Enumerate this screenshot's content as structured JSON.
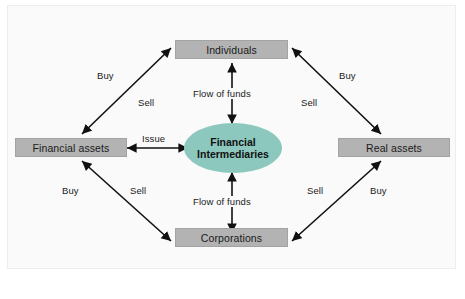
{
  "diagram": {
    "background_color": "#fafafa",
    "node_fill_color": "#b3b3b3",
    "intermediary_fill_color": "#8cc8bd",
    "line_color": "#111111",
    "nodes": {
      "individuals": {
        "label": "Individuals",
        "shape": "rectangle"
      },
      "corporations": {
        "label": "Corporations",
        "shape": "rectangle"
      },
      "financial_assets": {
        "label": "Financial assets",
        "shape": "rectangle"
      },
      "real_assets": {
        "label": "Real assets",
        "shape": "rectangle"
      },
      "intermediaries": {
        "label_line1": "Financial",
        "label_line2": "Intermediaries",
        "shape": "ellipse"
      }
    },
    "edge_labels": {
      "top_left_buy": "Buy",
      "top_left_sell": "Sell",
      "top_right_buy": "Buy",
      "top_right_sell": "Sell",
      "bottom_left_buy": "Buy",
      "bottom_left_sell": "Sell",
      "bottom_right_sell": "Sell",
      "bottom_right_buy": "Buy",
      "issue": "Issue",
      "flow_of_funds_top": "Flow of funds",
      "flow_of_funds_bottom": "Flow of funds"
    }
  }
}
